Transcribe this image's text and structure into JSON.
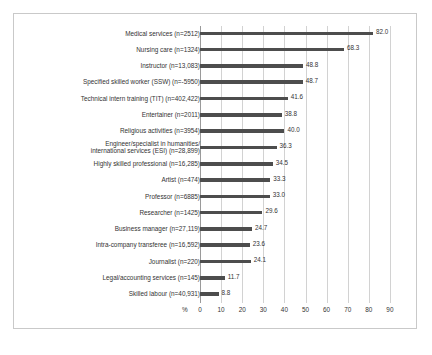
{
  "chart_data": {
    "type": "bar",
    "orientation": "horizontal",
    "title": "",
    "subtitle": "",
    "xlabel": "%",
    "ylabel": "",
    "xlim": [
      0,
      90
    ],
    "xticks": [
      0,
      10,
      20,
      30,
      40,
      50,
      60,
      70,
      80,
      90
    ],
    "xticklabels": [
      "0",
      "10",
      "20",
      "30",
      "40",
      "50",
      "60",
      "70",
      "80",
      "90"
    ],
    "grid": true,
    "legend": false,
    "axis_unit_label": "%",
    "categories": [
      "Medical services (n=2512)",
      "Nursing care (n=1324)",
      "Instructor (n=13,083)",
      "Specified skilled worker (SSW) (n=-5950)",
      "Technical intern training (TIT) (n=402,422)",
      "Entertainer (n=2011)",
      "Religious activities (n=3954)",
      "Engineer/specialist in humanities/\ninternational services (ESI) (n=28,899)",
      "Highly skilled professional (n=16,285)",
      "Artist (n=474)",
      "Professor (n=6885)",
      "Researcher (n=1425)",
      "Business manager (n=27,119)",
      "Intra-company transferee (n=16,592)",
      "Journalist (n=220)",
      "Legal/accounting services (n=145)",
      "Skilled labour (n=40,931)"
    ],
    "values": [
      82.0,
      68.3,
      48.8,
      48.7,
      41.6,
      38.8,
      40.0,
      36.3,
      34.5,
      33.3,
      33.0,
      29.6,
      24.7,
      23.6,
      24.1,
      11.7,
      8.8
    ],
    "value_labels": [
      "82.0",
      "68.3",
      "48.8",
      "48.7",
      "41.6",
      "38.8",
      "40.0",
      "36.3",
      "34.5",
      "33.3",
      "33.0",
      "29.6",
      "24.7",
      "23.6",
      "24.1",
      "11.7",
      "8.8"
    ],
    "bar_color": "#4d4d4d",
    "grid_color": "#d2d2d2",
    "frame_color": "#c9c9c9"
  }
}
